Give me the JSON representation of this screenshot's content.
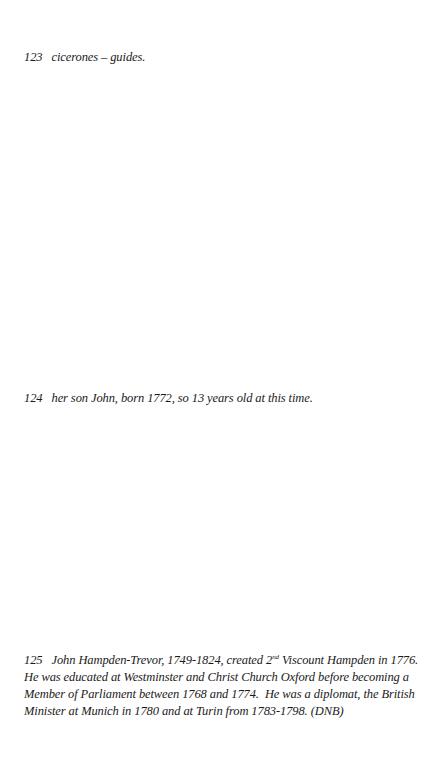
{
  "footnotes": [
    {
      "number": "123",
      "text": "cicerones – guides."
    },
    {
      "number": "124",
      "text": "her son John, born 1772, so 13 years old at this time."
    },
    {
      "number": "125",
      "text_part1": "John Hampden-Trevor, 1749-1824, created 2",
      "superscript": "nd",
      "text_part2": " Viscount Hampden in 1776.",
      "line2": "He was educated at Westminster and Christ Church Oxford before becoming a",
      "line3": "Member of Parliament between 1768 and 1774.  He was a diplomat, the British",
      "line4": "Minister at Munich in 1780 and at Turin from 1783-1798. (DNB)"
    }
  ]
}
